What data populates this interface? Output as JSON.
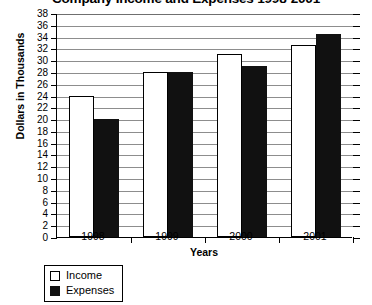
{
  "chart_data": {
    "type": "bar",
    "title": "Company Income and Expenses 1998-2001",
    "xlabel": "Years",
    "ylabel": "Dollars in Thousands",
    "categories": [
      "1998",
      "1999",
      "2000",
      "2001"
    ],
    "series": [
      {
        "name": "Income",
        "color": "#ffffff",
        "values": [
          24,
          28,
          31,
          32.5
        ]
      },
      {
        "name": "Expenses",
        "color": "#111111",
        "values": [
          20,
          28,
          29,
          34.5
        ]
      }
    ],
    "ylim": [
      0,
      38
    ],
    "ytick_step": 2,
    "yticks": [
      0,
      2,
      4,
      6,
      8,
      10,
      12,
      14,
      16,
      18,
      20,
      22,
      24,
      26,
      28,
      30,
      32,
      34,
      36,
      38
    ],
    "ytick_labels": [
      "0",
      "2",
      "4",
      "6",
      "8",
      "10",
      "12",
      "14",
      "16",
      "18",
      "20",
      "22",
      "24",
      "26",
      "28",
      "30",
      "32",
      "34",
      "36",
      "38"
    ],
    "grid": true,
    "legend_position": "below-left",
    "legend_entries": [
      "Income",
      "Expenses"
    ]
  }
}
